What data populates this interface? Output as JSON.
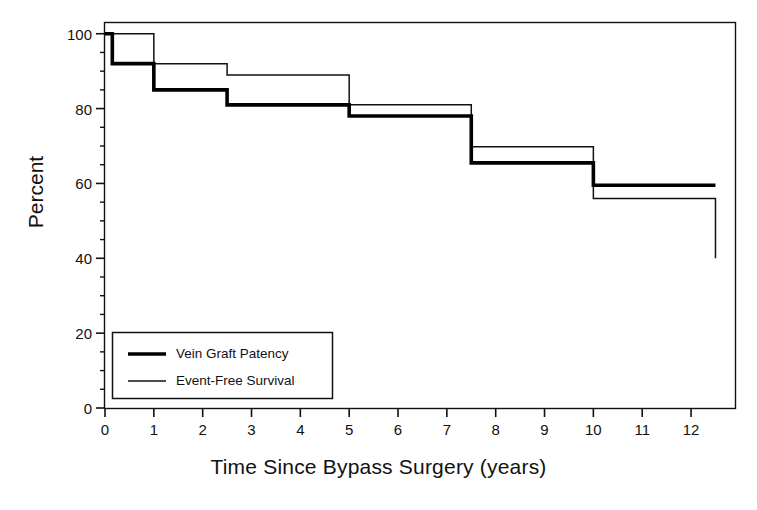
{
  "chart_data": {
    "type": "line",
    "subtype": "kaplan-meier-step",
    "title": "",
    "xlabel": "Time Since Bypass Surgery (years)",
    "ylabel": "Percent",
    "xlim": [
      0,
      12.9
    ],
    "ylim": [
      0,
      103
    ],
    "xticks": [
      0,
      1,
      2,
      3,
      4,
      5,
      6,
      7,
      8,
      9,
      10,
      11,
      12
    ],
    "xtick_labels": [
      "0",
      "1",
      "2",
      "3",
      "4",
      "5",
      "6",
      "7",
      "8",
      "9",
      "10",
      "11",
      "12"
    ],
    "yticks": [
      0,
      20,
      40,
      60,
      80,
      100
    ],
    "ytick_labels": [
      "0",
      "20",
      "40",
      "60",
      "80",
      "100"
    ],
    "yminor_step": 5,
    "grid": false,
    "frame": "box",
    "legend_position": "lower-left-inside",
    "series": [
      {
        "name": "Vein Graft Patency",
        "linewidth": "thick",
        "color": "#000000",
        "steps_x": [
          0,
          0.15,
          1.0,
          2.5,
          5.0,
          7.5,
          10.0,
          12.5
        ],
        "steps_y": [
          100,
          92,
          85,
          81,
          78,
          65.5,
          59.5,
          59.5
        ]
      },
      {
        "name": "Event-Free Survival",
        "linewidth": "thin",
        "color": "#000000",
        "steps_x": [
          0,
          1.0,
          2.5,
          5.0,
          7.5,
          10.0,
          12.5,
          12.5
        ],
        "steps_y": [
          100,
          92,
          89,
          81,
          69.8,
          56,
          56,
          40
        ]
      }
    ]
  },
  "legend": {
    "items": [
      {
        "label": "Vein Graft Patency",
        "style": "thick"
      },
      {
        "label": "Event-Free Survival",
        "style": "thin"
      }
    ]
  },
  "colors": {
    "background": "#ffffff",
    "ink": "#000000",
    "text": "#111111"
  }
}
